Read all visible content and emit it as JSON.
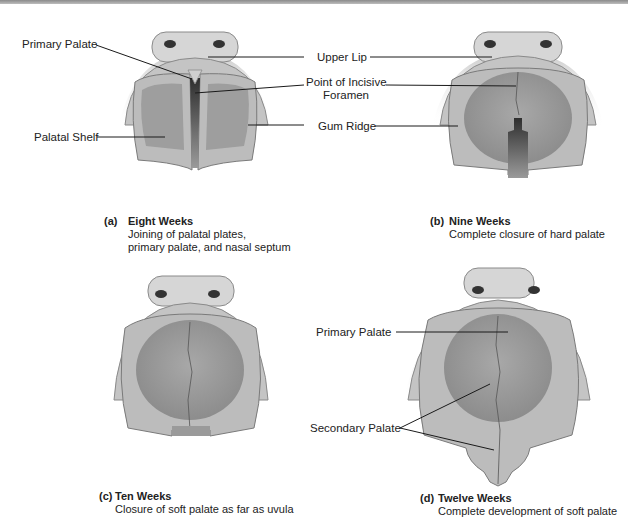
{
  "figure": {
    "panels": [
      {
        "id": "a",
        "letter": "(a)",
        "title": "Eight Weeks",
        "description_lines": [
          "Joining of palatal plates,",
          "primary palate, and nasal septum"
        ]
      },
      {
        "id": "b",
        "letter": "(b)",
        "title": "Nine Weeks",
        "description_lines": [
          "Complete closure of hard palate"
        ]
      },
      {
        "id": "c",
        "letter": "(c)",
        "title": "Ten Weeks",
        "description_lines": [
          "Closure of soft palate as far as uvula"
        ]
      },
      {
        "id": "d",
        "letter": "(d)",
        "title": "Twelve Weeks",
        "description_lines": [
          "Complete development of soft palate"
        ]
      }
    ],
    "labels": {
      "primary_palate_a": "Primary Palate",
      "palatal_shelf": "Palatal Shelf",
      "upper_lip": "Upper Lip",
      "incisive_foramen_line1": "Point of Incisive",
      "incisive_foramen_line2": "Foramen",
      "gum_ridge": "Gum Ridge",
      "primary_palate_d": "Primary Palate",
      "secondary_palate": "Secondary Palate"
    },
    "colors": {
      "tissue_light": "#d2d2d2",
      "tissue_mid": "#b4b4b4",
      "tissue_dark": "#8c8c8c",
      "cleft_dark": "#3c3c3c",
      "leader_line": "#1a1a1a"
    }
  }
}
